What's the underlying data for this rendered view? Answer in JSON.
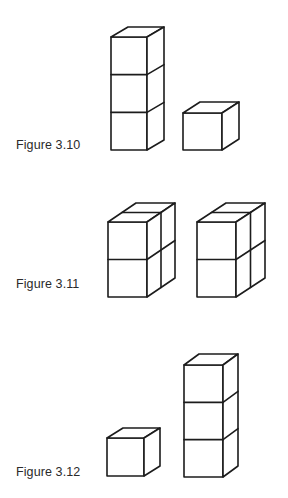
{
  "figures": [
    {
      "label": "Figure 3.10",
      "label_pos": {
        "x": 16,
        "y": 138
      },
      "structures": [
        {
          "name": "tower-3-cubes",
          "cols": 1,
          "rows": 3,
          "front_left": 111,
          "front_right": 147,
          "front_top": 37,
          "bottom": 150,
          "dx": 17,
          "dy": 10
        },
        {
          "name": "single-cube",
          "cols": 1,
          "rows": 1,
          "front_left": 183,
          "front_right": 222,
          "front_top": 113,
          "bottom": 150,
          "dx": 17,
          "dy": 11
        }
      ]
    },
    {
      "label": "Figure 3.11",
      "label_pos": {
        "x": 16,
        "y": 277
      },
      "structures": [
        {
          "name": "block-2x2-left",
          "cols": 1,
          "rows": 2,
          "depth": 2,
          "front_left": 108,
          "front_right": 147,
          "front_top": 222,
          "bottom": 297,
          "dx": 28,
          "dy": 19
        },
        {
          "name": "block-2x2-right",
          "cols": 1,
          "rows": 2,
          "depth": 2,
          "front_left": 197,
          "front_right": 236,
          "front_top": 222,
          "bottom": 297,
          "dx": 29,
          "dy": 19
        }
      ]
    },
    {
      "label": "Figure 3.12",
      "label_pos": {
        "x": 16,
        "y": 465
      },
      "structures": [
        {
          "name": "single-cube",
          "cols": 1,
          "rows": 1,
          "front_left": 107,
          "front_right": 144,
          "front_top": 438,
          "bottom": 476,
          "dx": 16,
          "dy": 10
        },
        {
          "name": "tower-3-cubes",
          "cols": 1,
          "rows": 3,
          "front_left": 184,
          "front_right": 223,
          "front_top": 365,
          "bottom": 477,
          "dx": 15,
          "dy": 11
        }
      ]
    }
  ],
  "colors": {
    "stroke": "#1c1c1c",
    "background": "#ffffff",
    "text": "#2a2a2a"
  }
}
